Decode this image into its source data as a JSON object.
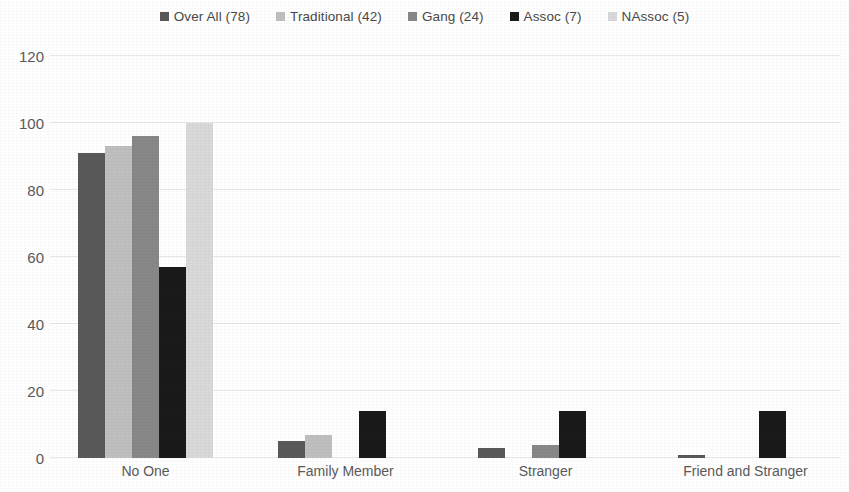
{
  "chart_data": {
    "type": "bar",
    "title": "",
    "subtitle": "",
    "xlabel": "",
    "ylabel": "",
    "categories": [
      "No One",
      "Family Member",
      "Stranger",
      "Friend and Stranger"
    ],
    "series": [
      {
        "name": "Over All (78)",
        "color": "#595959",
        "values": [
          91,
          5,
          3,
          1
        ]
      },
      {
        "name": "Traditional (42)",
        "color": "#bfbfbf",
        "values": [
          93,
          7,
          0,
          0
        ]
      },
      {
        "name": "Gang (24)",
        "color": "#888888",
        "values": [
          96,
          0,
          4,
          0
        ]
      },
      {
        "name": "Assoc (7)",
        "color": "#1a1a1a",
        "values": [
          57,
          14,
          14,
          14
        ]
      },
      {
        "name": "NAssoc (5)",
        "color": "#d9d9d9",
        "values": [
          100,
          0,
          0,
          0
        ]
      }
    ],
    "ylim": [
      0,
      120
    ],
    "yticks": [
      0,
      20,
      40,
      60,
      80,
      100,
      120
    ],
    "ytick_labels": [
      "0",
      "20",
      "40",
      "60",
      "80",
      "100",
      "120"
    ],
    "grid": true,
    "grid_axis": "y",
    "legend": {
      "position": "top",
      "entries": [
        {
          "label": "Over All (78)",
          "swatch": "#595959"
        },
        {
          "label": "Traditional (42)",
          "swatch": "#bfbfbf"
        },
        {
          "label": "Gang (24)",
          "swatch": "#888888"
        },
        {
          "label": "Assoc (7)",
          "swatch": "#1a1a1a"
        },
        {
          "label": "NAssoc (5)",
          "swatch": "#d9d9d9"
        }
      ]
    }
  }
}
